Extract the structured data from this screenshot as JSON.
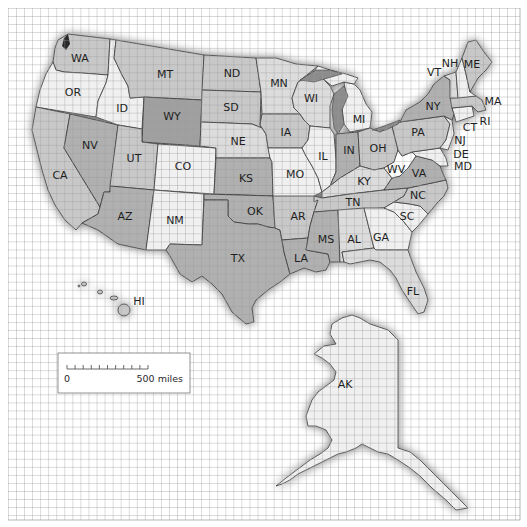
{
  "map": {
    "title": "United States",
    "grid": {
      "x0": 8,
      "y0": 8,
      "x1": 520,
      "y1": 520,
      "step": 8.05
    },
    "colors": {
      "background": "#ffffff",
      "grid": "#9a9a9a",
      "light": "#f0f0f0",
      "medium_light": "#dcdcdc",
      "medium": "#c8c8c8",
      "dark": "#b0b0b0",
      "darker": "#a0a0a0",
      "water": "#8c8c8c",
      "outline": "#3c3c3c"
    },
    "states": [
      {
        "abbr": "WA",
        "label_x": 80,
        "label_y": 58,
        "shade": "medium"
      },
      {
        "abbr": "OR",
        "label_x": 73,
        "label_y": 92,
        "shade": "light"
      },
      {
        "abbr": "CA",
        "label_x": 60,
        "label_y": 175,
        "shade": "medium"
      },
      {
        "abbr": "NV",
        "label_x": 90,
        "label_y": 145,
        "shade": "dark"
      },
      {
        "abbr": "ID",
        "label_x": 122,
        "label_y": 108,
        "shade": "light"
      },
      {
        "abbr": "MT",
        "label_x": 165,
        "label_y": 74,
        "shade": "medium"
      },
      {
        "abbr": "WY",
        "label_x": 172,
        "label_y": 116,
        "shade": "darker"
      },
      {
        "abbr": "UT",
        "label_x": 134,
        "label_y": 158,
        "shade": "medium"
      },
      {
        "abbr": "CO",
        "label_x": 183,
        "label_y": 166,
        "shade": "light"
      },
      {
        "abbr": "AZ",
        "label_x": 125,
        "label_y": 216,
        "shade": "dark"
      },
      {
        "abbr": "NM",
        "label_x": 175,
        "label_y": 220,
        "shade": "light"
      },
      {
        "abbr": "ND",
        "label_x": 232,
        "label_y": 73,
        "shade": "medium"
      },
      {
        "abbr": "SD",
        "label_x": 231,
        "label_y": 107,
        "shade": "medium"
      },
      {
        "abbr": "NE",
        "label_x": 238,
        "label_y": 141,
        "shade": "medium_light"
      },
      {
        "abbr": "KS",
        "label_x": 246,
        "label_y": 178,
        "shade": "dark"
      },
      {
        "abbr": "OK",
        "label_x": 255,
        "label_y": 211,
        "shade": "dark"
      },
      {
        "abbr": "TX",
        "label_x": 238,
        "label_y": 258,
        "shade": "dark"
      },
      {
        "abbr": "MN",
        "label_x": 279,
        "label_y": 83,
        "shade": "medium_light"
      },
      {
        "abbr": "IA",
        "label_x": 286,
        "label_y": 132,
        "shade": "medium"
      },
      {
        "abbr": "MO",
        "label_x": 295,
        "label_y": 174,
        "shade": "light"
      },
      {
        "abbr": "AR",
        "label_x": 298,
        "label_y": 216,
        "shade": "medium"
      },
      {
        "abbr": "LA",
        "label_x": 301,
        "label_y": 258,
        "shade": "dark"
      },
      {
        "abbr": "WI",
        "label_x": 311,
        "label_y": 98,
        "shade": "medium_light"
      },
      {
        "abbr": "IL",
        "label_x": 323,
        "label_y": 156,
        "shade": "light"
      },
      {
        "abbr": "MI",
        "label_x": 359,
        "label_y": 119,
        "shade": "light"
      },
      {
        "abbr": "IN",
        "label_x": 349,
        "label_y": 150,
        "shade": "dark"
      },
      {
        "abbr": "OH",
        "label_x": 378,
        "label_y": 148,
        "shade": "medium"
      },
      {
        "abbr": "KY",
        "label_x": 364,
        "label_y": 181,
        "shade": "medium_light"
      },
      {
        "abbr": "TN",
        "label_x": 353,
        "label_y": 202,
        "shade": "medium"
      },
      {
        "abbr": "MS",
        "label_x": 326,
        "label_y": 239,
        "shade": "dark"
      },
      {
        "abbr": "AL",
        "label_x": 354,
        "label_y": 239,
        "shade": "medium_light"
      },
      {
        "abbr": "GA",
        "label_x": 381,
        "label_y": 237,
        "shade": "light"
      },
      {
        "abbr": "FL",
        "label_x": 413,
        "label_y": 291,
        "shade": "medium_light"
      },
      {
        "abbr": "SC",
        "label_x": 407,
        "label_y": 216,
        "shade": "light"
      },
      {
        "abbr": "NC",
        "label_x": 418,
        "label_y": 195,
        "shade": "medium"
      },
      {
        "abbr": "VA",
        "label_x": 419,
        "label_y": 173,
        "shade": "dark"
      },
      {
        "abbr": "WV",
        "label_x": 396,
        "label_y": 169,
        "shade": "white"
      },
      {
        "abbr": "PA",
        "label_x": 418,
        "label_y": 132,
        "shade": "medium"
      },
      {
        "abbr": "NY",
        "label_x": 433,
        "label_y": 106,
        "shade": "dark"
      },
      {
        "abbr": "VT",
        "label_x": 434,
        "label_y": 72,
        "shade": "medium_light"
      },
      {
        "abbr": "NH",
        "label_x": 450,
        "label_y": 63,
        "shade": "light"
      },
      {
        "abbr": "ME",
        "label_x": 472,
        "label_y": 64,
        "shade": "medium"
      },
      {
        "abbr": "MA",
        "label_x": 493,
        "label_y": 101,
        "shade": "medium"
      },
      {
        "abbr": "RI",
        "label_x": 485,
        "label_y": 121,
        "shade": "light"
      },
      {
        "abbr": "CT",
        "label_x": 470,
        "label_y": 127,
        "shade": "light"
      },
      {
        "abbr": "NJ",
        "label_x": 460,
        "label_y": 140,
        "shade": "light"
      },
      {
        "abbr": "DE",
        "label_x": 461,
        "label_y": 154,
        "shade": "light"
      },
      {
        "abbr": "MD",
        "label_x": 463,
        "label_y": 166,
        "shade": "light"
      },
      {
        "abbr": "HI",
        "label_x": 139,
        "label_y": 301,
        "shade": "medium"
      },
      {
        "abbr": "AK",
        "label_x": 345,
        "label_y": 384,
        "shade": "light"
      }
    ],
    "scale_bar": {
      "start_label": "0",
      "end_label": "500 miles",
      "ticks": 10
    }
  }
}
